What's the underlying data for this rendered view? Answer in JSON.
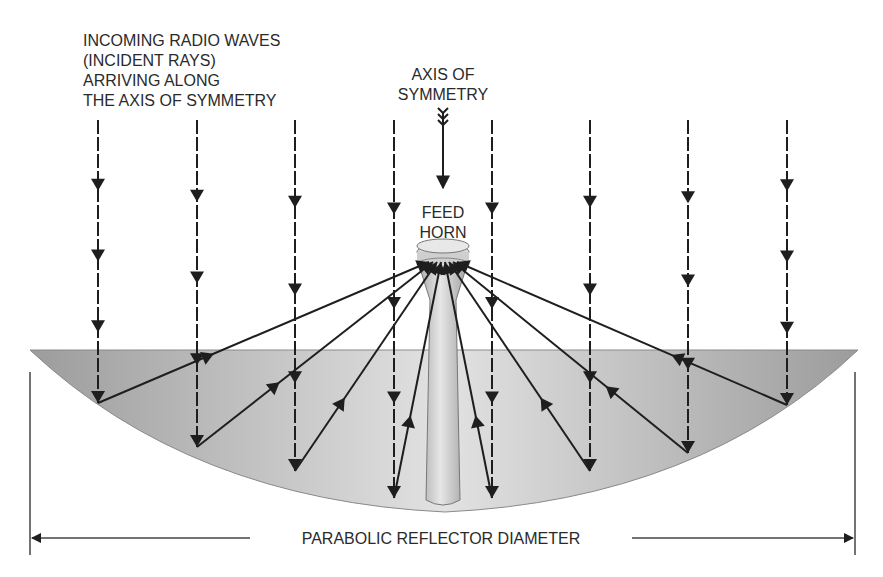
{
  "labels": {
    "incoming": [
      "INCOMING RADIO WAVES",
      "(INCIDENT RAYS)",
      "ARRIVING ALONG",
      "THE AXIS OF SYMMETRY"
    ],
    "axis": [
      "AXIS OF",
      "SYMMETRY"
    ],
    "feed": [
      "FEED",
      "HORN"
    ],
    "diameter": "PARABOLIC REFLECTOR DIAMETER"
  },
  "colors": {
    "ink": "#1e1e1e",
    "dish_dark": "#9a9a9a",
    "dish_light": "#dcdcdc",
    "horn": "#c8c8c8"
  },
  "rays": {
    "count": 8,
    "description": "incident parallel rays reflecting off parabolic dish toward feed horn focus"
  }
}
